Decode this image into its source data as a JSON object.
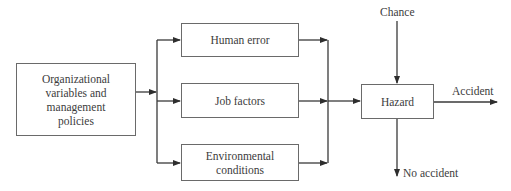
{
  "diagram": {
    "type": "flowchart",
    "nodes": {
      "org": {
        "label": "Organizational variables and management policies",
        "lines": [
          "Organizational",
          "variables and",
          "management",
          "policies"
        ]
      },
      "human_error": {
        "label": "Human error"
      },
      "job_factors": {
        "label": "Job factors"
      },
      "environmental": {
        "label": "Environmental conditions",
        "lines": [
          "Environmental",
          "conditions"
        ]
      },
      "hazard": {
        "label": "Hazard"
      }
    },
    "labels": {
      "chance": "Chance",
      "accident": "Accident",
      "no_accident": "No accident"
    },
    "edges": [
      {
        "from": "Organizational variables and management policies",
        "to": "Human error"
      },
      {
        "from": "Organizational variables and management policies",
        "to": "Job factors"
      },
      {
        "from": "Organizational variables and management policies",
        "to": "Environmental conditions"
      },
      {
        "from": "Human error",
        "to": "Hazard"
      },
      {
        "from": "Job factors",
        "to": "Hazard"
      },
      {
        "from": "Environmental conditions",
        "to": "Hazard"
      },
      {
        "from": "Chance",
        "to": "Hazard"
      },
      {
        "from": "Hazard",
        "to": "Accident"
      },
      {
        "from": "Hazard",
        "to": "No accident"
      }
    ],
    "colors": {
      "line": "#3a3a3a",
      "border": "#6a6a6a",
      "text": "#3c3c3c"
    }
  }
}
